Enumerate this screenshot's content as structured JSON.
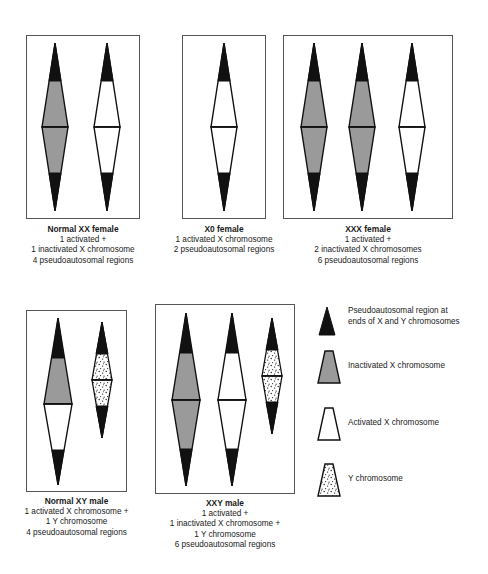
{
  "figure": {
    "colors": {
      "black": "#111111",
      "gray": "#9a9a9a",
      "white": "#ffffff",
      "outline": "#111111",
      "box_border": "#555555",
      "background": "#ffffff"
    },
    "panels": [
      {
        "id": "normal-xx-female",
        "title": "Normal XX female",
        "lines": [
          "1 activated +",
          "1 inactivated X chromosome",
          "4 pseudoautosomal regions"
        ],
        "chromosomes": [
          {
            "type": "X",
            "fill": "gray",
            "label": "inactivated-x-chromosome",
            "half": "full"
          },
          {
            "type": "X",
            "fill": "white",
            "label": "activated-x-chromosome",
            "half": "full"
          }
        ]
      },
      {
        "id": "x0-female",
        "title": "X0 female",
        "lines": [
          "1 activated X chromosome",
          "2 pseudoautosomal regions"
        ],
        "chromosomes": [
          {
            "type": "X",
            "fill": "white",
            "label": "activated-x-chromosome",
            "half": "full"
          }
        ]
      },
      {
        "id": "xxx-female",
        "title": "XXX female",
        "lines": [
          "1 activated +",
          "2 inactivated X chromosomes",
          "6 pseudoautosomal regions"
        ],
        "chromosomes": [
          {
            "type": "X",
            "fill": "gray",
            "label": "inactivated-x-chromosome",
            "half": "full"
          },
          {
            "type": "X",
            "fill": "gray",
            "label": "inactivated-x-chromosome",
            "half": "full"
          },
          {
            "type": "X",
            "fill": "white",
            "label": "activated-x-chromosome",
            "half": "full"
          }
        ]
      },
      {
        "id": "normal-xy-male",
        "title": "Normal XY male",
        "lines": [
          "1 activated X chromosome +",
          "1 Y chromosome",
          "4 pseudoautosomal regions"
        ],
        "chromosomes": [
          {
            "type": "X",
            "fill": "split",
            "label": "activated-x-chromosome",
            "half": "top-gray"
          },
          {
            "type": "Y",
            "fill": "stipple",
            "label": "y-chromosome",
            "half": "full"
          }
        ]
      },
      {
        "id": "xxy-male",
        "title": "XXY male",
        "lines": [
          "1 activated +",
          "1 inactivated X chromosome +",
          "1 Y chromosome",
          "6 pseudoautosomal regions"
        ],
        "chromosomes": [
          {
            "type": "X",
            "fill": "gray",
            "label": "inactivated-x-chromosome",
            "half": "full"
          },
          {
            "type": "X",
            "fill": "white",
            "label": "activated-x-chromosome",
            "half": "full"
          },
          {
            "type": "Y",
            "fill": "stipple",
            "label": "y-chromosome",
            "half": "full"
          }
        ]
      }
    ],
    "legend": [
      {
        "id": "pseudoautosomal-region",
        "swatch": "black-triangle",
        "lines": [
          "Pseudoautosomal region at",
          "ends of X and Y chromosomes"
        ]
      },
      {
        "id": "inactivated-x",
        "swatch": "gray-trapezoid",
        "lines": [
          "Inactivated X chromosome"
        ]
      },
      {
        "id": "activated-x",
        "swatch": "white-trapezoid",
        "lines": [
          "Activated X chromosome"
        ]
      },
      {
        "id": "y-chromosome",
        "swatch": "stippled-trapezoid",
        "lines": [
          "Y chromosome"
        ]
      }
    ]
  }
}
